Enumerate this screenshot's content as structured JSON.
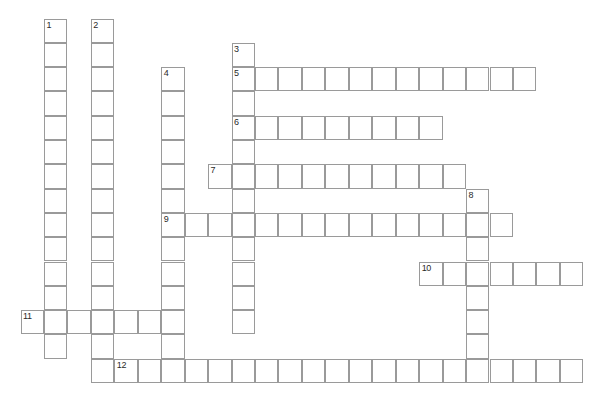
{
  "puzzle": {
    "title": "Crossword Puzzle Grid",
    "type": "crossword-grid",
    "canvas": {
      "width": 600,
      "height": 394,
      "background": "#ffffff"
    },
    "geometry": {
      "origin_x": 21,
      "origin_y": 19,
      "cell_width": 23.45,
      "cell_height": 24.3,
      "cell_border_color": "#9a9a9a",
      "cell_fill": "#ffffff",
      "number_color": "#2a2a2a"
    },
    "numbers_visible": [
      "1",
      "2",
      "3",
      "4",
      "5",
      "6",
      "7",
      "8",
      "9",
      "10",
      "11",
      "12"
    ],
    "entries": [
      {
        "number": "1",
        "direction": "down",
        "col": 1,
        "row": 0,
        "length": 14
      },
      {
        "number": "2",
        "direction": "down",
        "col": 3,
        "row": 0,
        "length": 15
      },
      {
        "number": "3",
        "direction": "down",
        "col": 9,
        "row": 1,
        "length": 12
      },
      {
        "number": "4",
        "direction": "down",
        "col": 6,
        "row": 2,
        "length": 13
      },
      {
        "number": "5",
        "direction": "across",
        "col": 9,
        "row": 2,
        "length": 13
      },
      {
        "number": "6",
        "direction": "across",
        "col": 9,
        "row": 4,
        "length": 9
      },
      {
        "number": "7",
        "direction": "across",
        "col": 8,
        "row": 6,
        "length": 11
      },
      {
        "number": "8",
        "direction": "down",
        "col": 19,
        "row": 7,
        "length": 8
      },
      {
        "number": "9",
        "direction": "across",
        "col": 6,
        "row": 8,
        "length": 15
      },
      {
        "number": "10",
        "direction": "across",
        "col": 17,
        "row": 10,
        "length": 7
      },
      {
        "number": "11",
        "direction": "across",
        "col": 0,
        "row": 12,
        "length": 7
      },
      {
        "number": "12",
        "direction": "across",
        "col": 4,
        "row": 14,
        "length": 20
      }
    ]
  }
}
